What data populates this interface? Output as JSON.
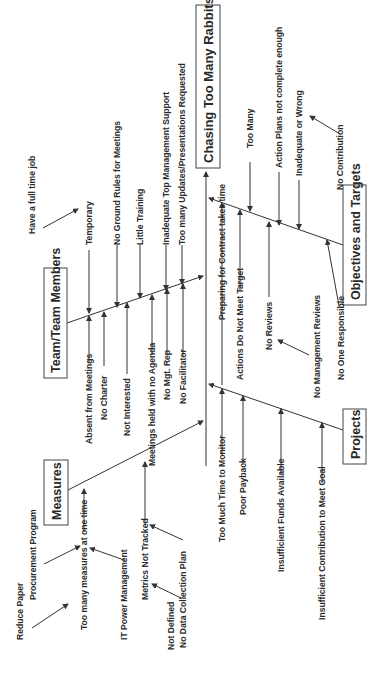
{
  "diagram": {
    "type": "fishbone",
    "orientation": "rotated-90-ccw",
    "effect": "Chasing Too Many Rabbits",
    "categories": [
      {
        "name": "Measures",
        "causes": [
          {
            "label": "Too many measures at one time",
            "sub": [
              "Reduce Paper",
              "Procurement Program",
              "IT Power Management"
            ]
          },
          {
            "label": "Metrics Not Tracked",
            "sub": [
              "Not Defined",
              "No Data Collection Plan"
            ]
          }
        ]
      },
      {
        "name": "Team/Team Members",
        "causes": [
          {
            "label": "Absent from Meetings",
            "sub": []
          },
          {
            "label": "Temporary",
            "sub": [
              "Have a full time job"
            ]
          },
          {
            "label": "No Charter",
            "sub": []
          },
          {
            "label": "No Ground Rules for Meetings",
            "sub": []
          },
          {
            "label": "Not Interested",
            "sub": []
          },
          {
            "label": "Little Training",
            "sub": []
          },
          {
            "label": "Meetings held with no Agenda",
            "sub": []
          },
          {
            "label": "Inadequate Top Management Support",
            "sub": []
          },
          {
            "label": "No Mgt. Rep",
            "sub": []
          },
          {
            "label": "Too many Updates/Presentations Requested",
            "sub": []
          },
          {
            "label": "No Facilitator",
            "sub": []
          }
        ]
      },
      {
        "name": "Projects",
        "causes": [
          {
            "label": "Too Much Time to Monitor",
            "sub": []
          },
          {
            "label": "Poor Payback",
            "sub": []
          },
          {
            "label": "Insufficient Funds Available",
            "sub": []
          },
          {
            "label": "Insufficient Contribution to Meet Goal",
            "sub": []
          }
        ]
      },
      {
        "name": "Objectives and Targets",
        "causes": [
          {
            "label": "Preparing for Contract takes time",
            "sub": []
          },
          {
            "label": "Too Many",
            "sub": []
          },
          {
            "label": "Actions Do Not Meet Target",
            "sub": []
          },
          {
            "label": "Action Plans not complete enough",
            "sub": []
          },
          {
            "label": "No Reviews",
            "sub": [
              "No Management Reviews"
            ]
          },
          {
            "label": "Inadequate or Wrong",
            "sub": [
              "No Contribution"
            ]
          },
          {
            "label": "No One Responsible",
            "sub": []
          }
        ]
      }
    ]
  },
  "labels": {
    "effect": "Chasing Too Many Rabbits",
    "cat_measures": "Measures",
    "cat_team": "Team/Team Members",
    "cat_projects": "Projects",
    "cat_objectives": "Objectives and Targets",
    "m_too_many": "Too many measures at one time",
    "m_reduce_paper": "Reduce Paper",
    "m_procurement": "Procurement Program",
    "m_it_power": "IT Power Management",
    "m_metrics": "Metrics Not Tracked",
    "m_not_defined": "Not Defined",
    "m_no_dcp": "No Data Collection Plan",
    "t_absent": "Absent from Meetings",
    "t_temporary": "Temporary",
    "t_fulltime": "Have a full time job",
    "t_no_charter": "No Charter",
    "t_ground_rules": "No Ground Rules for Meetings",
    "t_not_interested": "Not Interested",
    "t_little_training": "Little Training",
    "t_no_agenda": "Meetings held with no Agenda",
    "t_inadequate_support": "Inadequate Top Management Support",
    "t_no_mgt_rep": "No Mgt. Rep",
    "t_too_many_updates": "Too many Updates/Presentations Requested",
    "t_no_facilitator": "No Facilitator",
    "p_too_much_time": "Too Much Time to Monitor",
    "p_poor_payback": "Poor Payback",
    "p_insufficient_funds": "Insufficient Funds Available",
    "p_insufficient_contrib": "Insufficient Contribution to Meet Goal",
    "o_preparing": "Preparing for Contract takes time",
    "o_too_many": "Too Many",
    "o_actions_not_meet": "Actions Do Not Meet Target",
    "o_action_plans": "Action Plans not complete enough",
    "o_no_reviews": "No Reviews",
    "o_no_mgmt_reviews": "No Management Reviews",
    "o_inadequate": "Inadequate or Wrong",
    "o_no_contribution": "No Contribution",
    "o_no_one": "No One Responsible"
  }
}
